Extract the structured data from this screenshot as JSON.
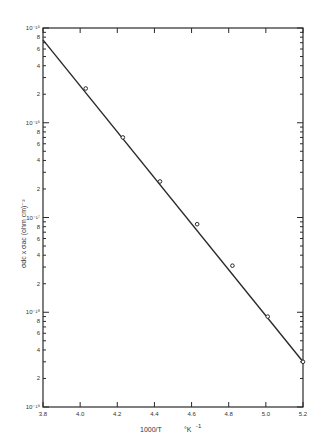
{
  "chart_data": {
    "type": "scatter",
    "title": "",
    "xlabel": "1000/T  °K⁻¹",
    "ylabel": "σdc x σac (ohm cm)⁻²",
    "x_scale": "linear",
    "y_scale": "log",
    "xlim": [
      3.8,
      5.2
    ],
    "ylim": [
      1e-19,
      1e-15
    ],
    "x_ticks": [
      "3.8",
      "4.0",
      "4.2",
      "4.4",
      "4.6",
      "4.8",
      "5.0",
      "5.2"
    ],
    "y_decade_labels": [
      "10⁻¹⁵",
      "10⁻¹⁶",
      "10⁻¹⁷",
      "10⁻¹⁸",
      "10⁻¹⁹"
    ],
    "y_minor_labels": [
      "8",
      "6",
      "4",
      "2"
    ],
    "grid": false,
    "legend": null,
    "series": [
      {
        "name": "measured",
        "marker": "open-circle",
        "x": [
          4.03,
          4.23,
          4.43,
          4.63,
          4.82,
          5.01,
          5.2
        ],
        "y": [
          2.3e-16,
          7e-17,
          2.4e-17,
          8.5e-18,
          3.1e-18,
          9e-19,
          3e-19
        ]
      },
      {
        "name": "fit",
        "style": "line",
        "x": [
          3.8,
          5.2
        ],
        "y": [
          7.5e-16,
          3e-19
        ]
      }
    ]
  },
  "labels": {
    "xlabel_main": "1000/T",
    "xlabel_unit": "°K",
    "xlabel_exp": "-1",
    "ylabel": "σdc x σac (ohm cm)⁻²"
  }
}
